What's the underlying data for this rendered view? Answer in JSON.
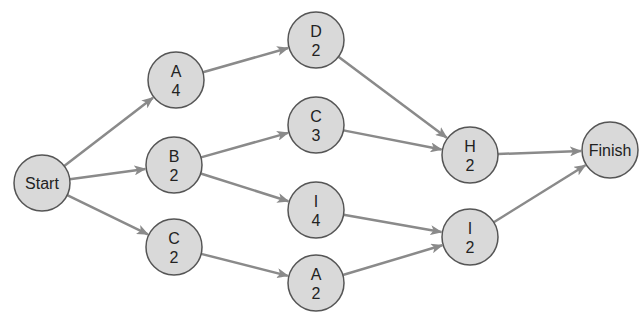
{
  "diagram": {
    "type": "activity-on-node network",
    "colors": {
      "node_fill": "#d9d9d9",
      "node_stroke": "#555555",
      "edge": "#8a8a8a"
    },
    "nodes": [
      {
        "id": "start",
        "label": "Start",
        "duration": "",
        "x": 42,
        "y": 183
      },
      {
        "id": "a4",
        "label": "A",
        "duration": "4",
        "x": 176,
        "y": 80
      },
      {
        "id": "b2",
        "label": "B",
        "duration": "2",
        "x": 174,
        "y": 165
      },
      {
        "id": "c2",
        "label": "C",
        "duration": "2",
        "x": 174,
        "y": 247
      },
      {
        "id": "d2",
        "label": "D",
        "duration": "2",
        "x": 316,
        "y": 40
      },
      {
        "id": "c3",
        "label": "C",
        "duration": "3",
        "x": 316,
        "y": 125
      },
      {
        "id": "i4",
        "label": "I",
        "duration": "4",
        "x": 316,
        "y": 210
      },
      {
        "id": "a2",
        "label": "A",
        "duration": "2",
        "x": 316,
        "y": 283
      },
      {
        "id": "h2",
        "label": "H",
        "duration": "2",
        "x": 470,
        "y": 155
      },
      {
        "id": "i2",
        "label": "I",
        "duration": "2",
        "x": 470,
        "y": 237
      },
      {
        "id": "finish",
        "label": "Finish",
        "duration": "",
        "x": 610,
        "y": 150
      }
    ],
    "edges": [
      [
        "start",
        "a4"
      ],
      [
        "start",
        "b2"
      ],
      [
        "start",
        "c2"
      ],
      [
        "a4",
        "d2"
      ],
      [
        "b2",
        "c3"
      ],
      [
        "b2",
        "i4"
      ],
      [
        "c2",
        "a2"
      ],
      [
        "d2",
        "h2"
      ],
      [
        "c3",
        "h2"
      ],
      [
        "i4",
        "i2"
      ],
      [
        "a2",
        "i2"
      ],
      [
        "h2",
        "finish"
      ],
      [
        "i2",
        "finish"
      ]
    ]
  }
}
